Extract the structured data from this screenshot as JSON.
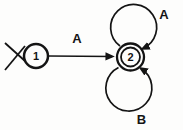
{
  "diagram": {
    "type": "finite-state-automaton",
    "background": "#fdfdfc",
    "ink": "#141414",
    "states": [
      {
        "label": "1",
        "initial": true,
        "accepting": false
      },
      {
        "label": "2",
        "initial": false,
        "accepting": true
      }
    ],
    "transitions": [
      {
        "from": "1",
        "to": "2",
        "label": "A",
        "shape": "straight-arrow"
      },
      {
        "from": "2",
        "to": "2",
        "label": "A",
        "shape": "self-loop-top"
      },
      {
        "from": "2",
        "to": "2",
        "label": "B",
        "shape": "self-loop-bottom"
      }
    ]
  }
}
